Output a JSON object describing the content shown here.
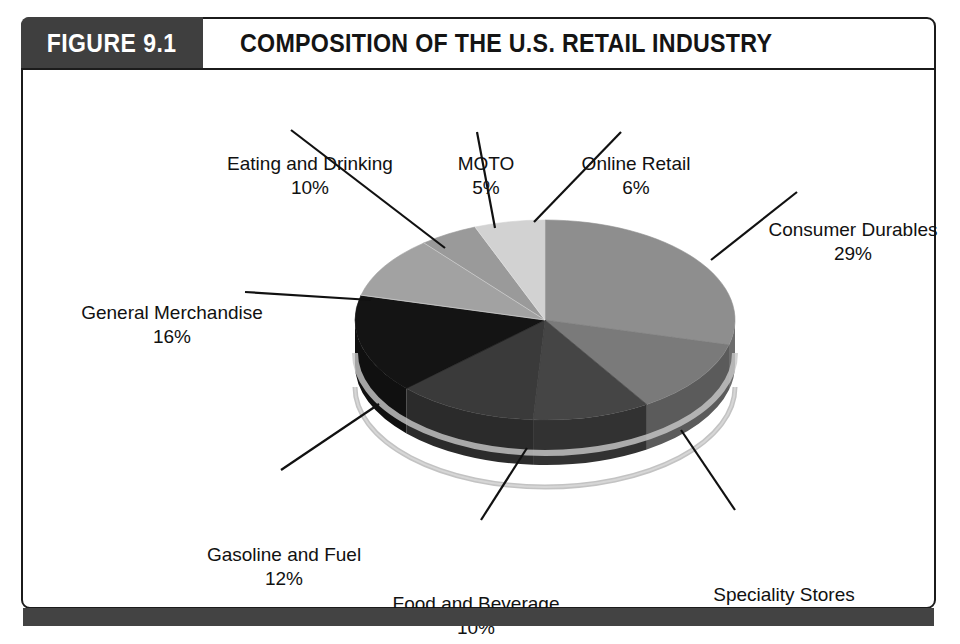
{
  "figure": {
    "number_label": "FIGURE 9.1",
    "title": "COMPOSITION OF THE U.S. RETAIL INDUSTRY"
  },
  "colors": {
    "figure_number_box": "#3f3f3f",
    "frame_border": "#1b1b1b",
    "footer_bar": "#434343",
    "label_text": "#111111"
  },
  "chart_data": {
    "type": "pie",
    "title": "Composition of the U.S. Retail Industry",
    "units": "percent",
    "three_d": true,
    "legend_position": "none",
    "labels_outside_with_leader_lines": true,
    "categories": [
      "Consumer Durables",
      "Speciality Stores",
      "Food and Beverage",
      "Gasoline and Fuel",
      "General Merchandise",
      "Eating and Drinking",
      "MOTO",
      "Online Retail"
    ],
    "values": [
      29,
      12,
      10,
      12,
      16,
      10,
      5,
      6
    ],
    "slices": [
      {
        "name": "Consumer Durables",
        "value": 29,
        "value_text": "29%",
        "color": "#8e8e8e",
        "side_color": "#6c6c6c"
      },
      {
        "name": "Speciality Stores",
        "value": 12,
        "value_text": "12%",
        "color": "#7a7a7a",
        "side_color": "#5b5b5b"
      },
      {
        "name": "Food and Beverage",
        "value": 10,
        "value_text": "10%",
        "color": "#454545",
        "side_color": "#323232"
      },
      {
        "name": "Gasoline and Fuel",
        "value": 12,
        "value_text": "12%",
        "color": "#3a3a3a",
        "side_color": "#2b2b2b"
      },
      {
        "name": "General Merchandise",
        "value": 16,
        "value_text": "16%",
        "color": "#141414",
        "side_color": "#101010"
      },
      {
        "name": "Eating and Drinking",
        "value": 10,
        "value_text": "10%",
        "color": "#a2a2a2",
        "side_color": "#7d7d7d"
      },
      {
        "name": "MOTO",
        "value": 5,
        "value_text": "5%",
        "color": "#9a9a9a",
        "side_color": "#757575"
      },
      {
        "name": "Online Retail",
        "value": 6,
        "value_text": "6%",
        "color": "#d2d2d2",
        "side_color": "#a3a3a3"
      }
    ]
  },
  "labels": {
    "eating": {
      "name": "Eating and Drinking",
      "value": "10%"
    },
    "moto": {
      "name": "MOTO",
      "value": "5%"
    },
    "online": {
      "name": "Online Retail",
      "value": "6%"
    },
    "consumer": {
      "name": "Consumer Durables",
      "value": "29%"
    },
    "general": {
      "name": "General Merchandise",
      "value": "16%"
    },
    "gasoline": {
      "name": "Gasoline and Fuel",
      "value": "12%"
    },
    "food": {
      "name": "Food and Beverage",
      "value": "10%"
    },
    "speciality": {
      "name": "Speciality Stores",
      "value": "12%"
    }
  }
}
